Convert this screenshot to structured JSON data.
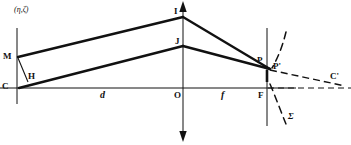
{
  "figure": {
    "ink_color": "#111111",
    "background_color": "#ffffff",
    "width": 351,
    "height": 145
  },
  "annotations": {
    "object_coords": "(η,ζ)",
    "aperture_symbol": "Σ"
  },
  "points": [
    {
      "key": "M",
      "label": "M",
      "x": 17,
      "y": 57,
      "label_x": 3,
      "label_y": 52
    },
    {
      "key": "H",
      "label": "H",
      "x": 27,
      "y": 82,
      "label_x": 28,
      "label_y": 73
    },
    {
      "key": "C",
      "label": "C",
      "x": 17,
      "y": 88,
      "label_x": 2,
      "label_y": 82
    },
    {
      "key": "I",
      "label": "I",
      "x": 183,
      "y": 16,
      "label_x": 174,
      "label_y": 8
    },
    {
      "key": "J",
      "label": "J",
      "x": 183,
      "y": 45,
      "label_x": 175,
      "label_y": 37
    },
    {
      "key": "O",
      "label": "O",
      "x": 183,
      "y": 88,
      "label_x": 174,
      "label_y": 91
    },
    {
      "key": "F",
      "label": "F",
      "x": 267,
      "y": 88,
      "label_x": 259,
      "label_y": 91
    },
    {
      "key": "P",
      "label": "P",
      "x": 264,
      "y": 66,
      "label_x": 258,
      "label_y": 57
    },
    {
      "key": "P'",
      "label": "P'",
      "x": 273,
      "y": 70,
      "label_x": 273,
      "label_y": 63
    },
    {
      "key": "C'",
      "label": "C'",
      "x": 330,
      "y": 82,
      "label_x": 330,
      "label_y": 73
    }
  ],
  "segment_labels": [
    {
      "key": "d",
      "label": "d",
      "x": 100,
      "y": 91
    },
    {
      "key": "f",
      "label": "f",
      "x": 220,
      "y": 91
    }
  ],
  "axes": {
    "optical_axis": {
      "from_x": 0,
      "to_x": 351,
      "y": 88
    },
    "object_plane": {
      "x": 17,
      "from_y": 28,
      "to_y": 104
    },
    "lens_plane": {
      "x": 183,
      "from_y": 2,
      "to_y": 140
    },
    "image_plane": {
      "x": 267,
      "from_y": 28,
      "to_y": 126
    }
  },
  "rays": [
    {
      "name": "upper-ray-M-to-I",
      "from": "M",
      "to": "I",
      "style": "solid"
    },
    {
      "name": "upper-ray-I-to-P",
      "from": "I",
      "to": "P'",
      "style": "solid"
    },
    {
      "name": "lower-ray-C-to-J",
      "from": "C",
      "to": "J",
      "style": "solid"
    },
    {
      "name": "lower-ray-J-to-P",
      "from": "J",
      "to": "P'",
      "style": "solid"
    },
    {
      "name": "chief-ray-M-to-H",
      "from": "M",
      "to": "H",
      "style": "solid"
    },
    {
      "name": "virtual-ray-P-to-C",
      "from": "P'",
      "to": "C'",
      "style": "dashed"
    },
    {
      "name": "axis-extension-F-to-right",
      "from": "F",
      "to": "right-edge",
      "style": "dashed"
    }
  ],
  "arcs": [
    {
      "name": "wavefront-upper-arc",
      "style": "dashed"
    },
    {
      "name": "wavefront-lower-arc",
      "style": "dashed"
    }
  ]
}
